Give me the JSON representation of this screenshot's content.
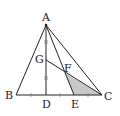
{
  "diagram": {
    "type": "geometry",
    "points": {
      "A": {
        "label": "A",
        "x": 46,
        "y": 25
      },
      "B": {
        "label": "B",
        "x": 16,
        "y": 95
      },
      "C": {
        "label": "C",
        "x": 102,
        "y": 95
      },
      "D": {
        "label": "D",
        "x": 46,
        "y": 95
      },
      "E": {
        "label": "E",
        "x": 74,
        "y": 95
      },
      "G": {
        "label": "G",
        "x": 46,
        "y": 60
      },
      "F": {
        "label": "F",
        "x": 65,
        "y": 73
      }
    },
    "shaded_region": [
      "F",
      "E",
      "C"
    ],
    "shade_color": "#c8c8c8",
    "line_color": "#222222",
    "equal_marks": {
      "AD_segments": "AG = GD (double tick marks)",
      "BC_segments": "BC divided into 4 equal parts by tick marks"
    }
  }
}
